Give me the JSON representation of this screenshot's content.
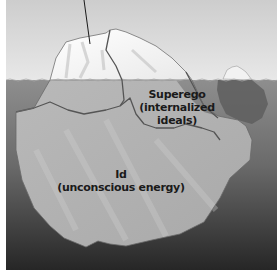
{
  "diagram": {
    "type": "iceberg-model",
    "labels": {
      "superego": {
        "title": "Superego",
        "line2": "(internalized",
        "line3": "ideals)"
      },
      "id": {
        "title": "Id",
        "line2": "(unconscious energy)"
      }
    },
    "colors": {
      "sky_top": "#cfcfcf",
      "sky_bottom": "#e6e6e6",
      "water_top": "#8f8f8f",
      "water_bottom": "#2a2a2a",
      "ice_above": "#f4f4f4",
      "ice_below": "#b5b5b5",
      "outline": "#5a5a5a"
    }
  }
}
